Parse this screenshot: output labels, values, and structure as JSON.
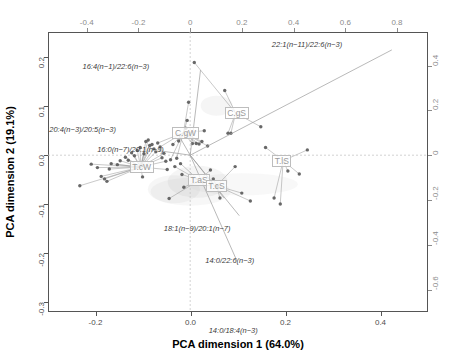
{
  "chart_data": {
    "type": "scatter",
    "title": "",
    "xlabel": "PCA dimension 1 (64.0%)",
    "ylabel": "PCA dimension 2 (19.1%)",
    "xlim": [
      -0.3,
      0.5
    ],
    "ylim": [
      -0.32,
      0.25
    ],
    "xticks": [
      "-0.2",
      "0.0",
      "0.2",
      "0.4"
    ],
    "xtick_values": [
      -0.2,
      0.0,
      0.2,
      0.4
    ],
    "yticks": [
      "-0.3",
      "-0.2",
      "-0.1",
      "0.0",
      "0.1",
      "0.2"
    ],
    "ytick_values": [
      -0.3,
      -0.2,
      -0.1,
      0.0,
      0.1,
      0.2
    ],
    "xticks_top": [
      "-0.4",
      "-0.2",
      "0",
      "0.2",
      "0.4",
      "0.6",
      "0.8"
    ],
    "xtick_top_values": [
      -0.4,
      -0.2,
      0,
      0.2,
      0.4,
      0.6,
      0.8
    ],
    "yticks_right": [
      "-0.6",
      "-0.4",
      "-0.2",
      "0",
      "0.2",
      "0.4"
    ],
    "ytick_right_values": [
      -0.6,
      -0.4,
      -0.2,
      0,
      0.2,
      0.4
    ],
    "grid": false,
    "legend": "none",
    "vectors": [
      {
        "label": "22:1(n-11)/22:6(n-3)",
        "x": 0.78,
        "y": 0.47
      },
      {
        "label": "16:4(n-1)/22:6(n-3)",
        "x": 0.04,
        "y": 0.38
      },
      {
        "label": "20:4(n-3)/20:5(n-3)",
        "x": -0.05,
        "y": 0.1
      },
      {
        "label": "16:0(n-7)/20:1(n-9)",
        "x": -0.12,
        "y": 0.02
      },
      {
        "label": "18:1(n-9)/20:1(n-7)",
        "x": 0.13,
        "y": -0.19
      },
      {
        "label": "14:0/22:6(n-3)",
        "x": 0.19,
        "y": -0.27
      },
      {
        "label": "14:0/18:4(n-3)",
        "x": 0.18,
        "y": -0.47
      }
    ],
    "group_labels": [
      {
        "label": "C.gS",
        "x": 0.095,
        "y": 0.085
      },
      {
        "label": "C.gW",
        "x": -0.015,
        "y": 0.045
      },
      {
        "label": "T.cW",
        "x": -0.105,
        "y": -0.025
      },
      {
        "label": "T.aS",
        "x": 0.018,
        "y": -0.052
      },
      {
        "label": "T.cS",
        "x": 0.055,
        "y": -0.063
      },
      {
        "label": "T.lS",
        "x": 0.195,
        "y": -0.012
      }
    ],
    "points": [
      {
        "x": -0.233,
        "y": -0.063
      },
      {
        "x": -0.209,
        "y": -0.019
      },
      {
        "x": -0.196,
        "y": -0.026
      },
      {
        "x": -0.188,
        "y": -0.044
      },
      {
        "x": -0.181,
        "y": -0.049
      },
      {
        "x": -0.176,
        "y": -0.054
      },
      {
        "x": -0.171,
        "y": -0.029
      },
      {
        "x": -0.167,
        "y": -0.018
      },
      {
        "x": -0.154,
        "y": -0.02
      },
      {
        "x": -0.148,
        "y": -0.012
      },
      {
        "x": -0.137,
        "y": -0.005
      },
      {
        "x": -0.131,
        "y": -0.011
      },
      {
        "x": -0.124,
        "y": 0.004
      },
      {
        "x": -0.118,
        "y": -0.002
      },
      {
        "x": -0.112,
        "y": 0.009
      },
      {
        "x": -0.106,
        "y": 0.015
      },
      {
        "x": -0.101,
        "y": -0.045
      },
      {
        "x": -0.098,
        "y": 0.002
      },
      {
        "x": -0.094,
        "y": 0.027
      },
      {
        "x": -0.089,
        "y": 0.03
      },
      {
        "x": -0.086,
        "y": 0.019
      },
      {
        "x": -0.081,
        "y": 0.021
      },
      {
        "x": -0.077,
        "y": 0.012
      },
      {
        "x": -0.073,
        "y": 0.006
      },
      {
        "x": -0.069,
        "y": 0.024
      },
      {
        "x": -0.064,
        "y": 0.016
      },
      {
        "x": -0.06,
        "y": -0.006
      },
      {
        "x": -0.056,
        "y": 0.003
      },
      {
        "x": -0.052,
        "y": -0.013
      },
      {
        "x": -0.049,
        "y": -0.03
      },
      {
        "x": -0.045,
        "y": -0.089
      },
      {
        "x": -0.042,
        "y": -0.01
      },
      {
        "x": -0.037,
        "y": 0.021
      },
      {
        "x": -0.033,
        "y": -0.024
      },
      {
        "x": -0.029,
        "y": -0.007
      },
      {
        "x": -0.025,
        "y": 0.028
      },
      {
        "x": -0.021,
        "y": -0.018
      },
      {
        "x": -0.018,
        "y": -0.04
      },
      {
        "x": -0.014,
        "y": -0.066
      },
      {
        "x": -0.01,
        "y": 0.054
      },
      {
        "x": -0.007,
        "y": 0.07
      },
      {
        "x": -0.004,
        "y": 0.107
      },
      {
        "x": 0.004,
        "y": 0.023
      },
      {
        "x": 0.008,
        "y": 0.188
      },
      {
        "x": 0.012,
        "y": 0.023
      },
      {
        "x": 0.018,
        "y": 0.022
      },
      {
        "x": 0.024,
        "y": 0.027
      },
      {
        "x": 0.029,
        "y": 0.049
      },
      {
        "x": 0.036,
        "y": 0.018
      },
      {
        "x": 0.042,
        "y": -0.031
      },
      {
        "x": 0.048,
        "y": -0.049
      },
      {
        "x": 0.055,
        "y": -0.064
      },
      {
        "x": 0.062,
        "y": -0.088
      },
      {
        "x": 0.072,
        "y": 0.131
      },
      {
        "x": 0.079,
        "y": 0.044
      },
      {
        "x": 0.085,
        "y": 0.044
      },
      {
        "x": 0.094,
        "y": -0.024
      },
      {
        "x": 0.108,
        "y": -0.078
      },
      {
        "x": 0.126,
        "y": -0.094
      },
      {
        "x": 0.148,
        "y": 0.057
      },
      {
        "x": 0.158,
        "y": 0.015
      },
      {
        "x": 0.176,
        "y": -0.088
      },
      {
        "x": 0.189,
        "y": -0.1
      },
      {
        "x": 0.205,
        "y": -0.033
      },
      {
        "x": 0.229,
        "y": -0.039
      },
      {
        "x": 0.246,
        "y": 0.01
      }
    ]
  }
}
